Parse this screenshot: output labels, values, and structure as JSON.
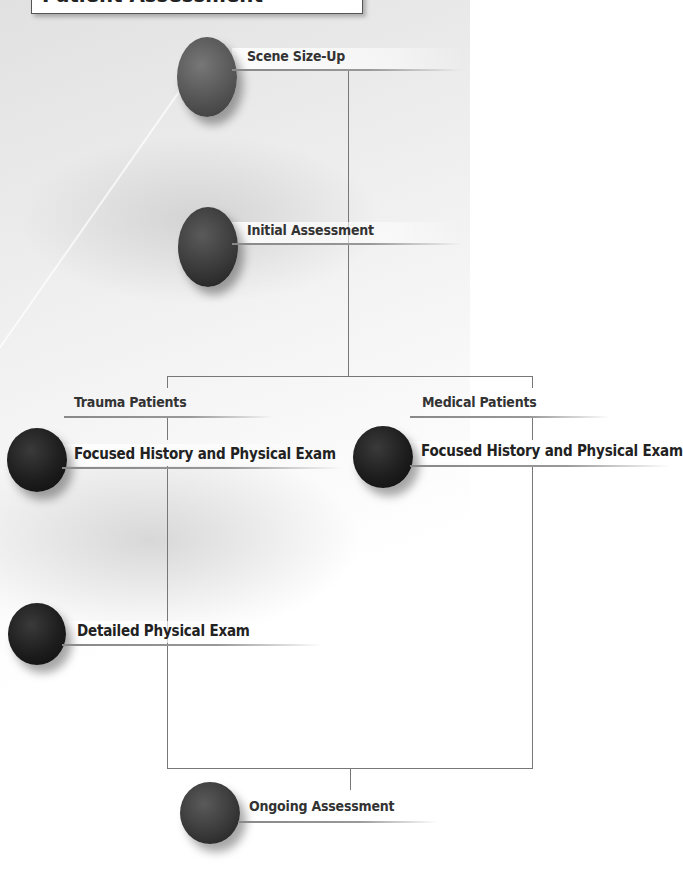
{
  "title": "Patient Assessment",
  "nodes": {
    "scene_size_up": "Scene Size-Up",
    "initial_assessment": "Initial Assessment",
    "trauma_patients": "Trauma Patients",
    "medical_patients": "Medical Patients",
    "trauma_focused_exam": "Focused History and Physical Exam",
    "medical_focused_exam": "Focused History and Physical Exam",
    "detailed_exam": "Detailed Physical Exam",
    "ongoing_assessment": "Ongoing Assessment"
  }
}
